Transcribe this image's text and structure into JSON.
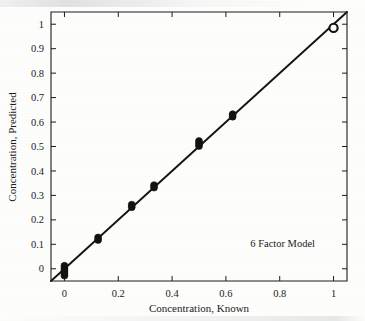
{
  "chart_data": {
    "type": "scatter",
    "title": "",
    "xlabel": "Concentration, Known",
    "ylabel": "Concentration, Predicted",
    "xlim": [
      -0.05,
      1.05
    ],
    "ylim": [
      -0.05,
      1.05
    ],
    "grid": false,
    "legend": "none",
    "annotations": [
      {
        "text": "6 Factor Model",
        "x": 0.72,
        "y": 0.13
      }
    ],
    "xticks": [
      "0",
      "0.2",
      "0.4",
      "0.6",
      "0.8",
      "1"
    ],
    "xtick_values": [
      0,
      0.2,
      0.4,
      0.6,
      0.8,
      1
    ],
    "yticks": [
      "0",
      "0.1",
      "0.2",
      "0.3",
      "0.4",
      "0.5",
      "0.6",
      "0.7",
      "0.8",
      "0.9",
      "1"
    ],
    "ytick_values": [
      0,
      0.1,
      0.2,
      0.3,
      0.4,
      0.5,
      0.6,
      0.7,
      0.8,
      0.9,
      1
    ],
    "series": [
      {
        "name": "Samples",
        "marker": "filled-circle",
        "color": "#121212",
        "points": [
          {
            "x": 0.0,
            "y": 0.012
          },
          {
            "x": 0.0,
            "y": 0.002
          },
          {
            "x": 0.0,
            "y": -0.008
          },
          {
            "x": 0.0,
            "y": -0.018
          },
          {
            "x": 0.0,
            "y": -0.028
          },
          {
            "x": 0.125,
            "y": 0.128
          },
          {
            "x": 0.125,
            "y": 0.118
          },
          {
            "x": 0.25,
            "y": 0.262
          },
          {
            "x": 0.25,
            "y": 0.252
          },
          {
            "x": 0.333,
            "y": 0.342
          },
          {
            "x": 0.333,
            "y": 0.332
          },
          {
            "x": 0.5,
            "y": 0.522
          },
          {
            "x": 0.5,
            "y": 0.512
          },
          {
            "x": 0.5,
            "y": 0.502
          },
          {
            "x": 0.625,
            "y": 0.632
          },
          {
            "x": 0.625,
            "y": 0.622
          }
        ]
      },
      {
        "name": "Top standard",
        "marker": "open-circle",
        "color": "#121212",
        "points": [
          {
            "x": 1.0,
            "y": 0.985
          }
        ]
      }
    ],
    "fit_line": {
      "type": "identity",
      "slope": 1,
      "intercept": 0,
      "x_start": -0.05,
      "x_end": 1.05,
      "color": "#141414"
    }
  }
}
